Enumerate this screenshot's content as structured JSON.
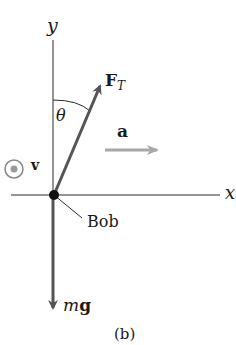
{
  "diagram": {
    "caption": "(b)",
    "axes": {
      "x_label": "x",
      "y_label": "y"
    },
    "angle_label": "θ",
    "velocity": {
      "label": "v",
      "symbol": "out-of-page-dot"
    },
    "tension": {
      "main": "F",
      "sub": "T"
    },
    "acceleration": {
      "label": "a"
    },
    "weight": {
      "m": "m",
      "g": "g"
    },
    "bob_label": "Bob",
    "colors": {
      "axis": "#2a2a2a",
      "force_vector": "#555555",
      "accel_vector": "#a8a8a8",
      "velocity_symbol": "#888888",
      "bob": "#111111"
    }
  }
}
